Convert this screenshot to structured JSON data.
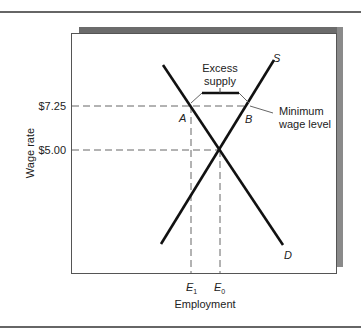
{
  "diagram": {
    "type": "supply-demand",
    "y_axis_label": "Wage rate",
    "x_axis_label": "Employment",
    "y_ticks": [
      "$7.25",
      "$5.00"
    ],
    "x_ticks": {
      "e1": "E",
      "e1_sub": "1",
      "e0": "E",
      "e0_sub": "0"
    },
    "curves": {
      "supply": "S",
      "demand": "D"
    },
    "points": {
      "a": "A",
      "b": "B"
    },
    "annotations": {
      "excess_line1": "Excess",
      "excess_line2": "supply",
      "min_wage_line1": "Minimum",
      "min_wage_line2": "wage level"
    },
    "colors": {
      "line": "#111111",
      "frame": "#555555",
      "shadow": "#6b6b6b",
      "dash": "#666666"
    }
  }
}
